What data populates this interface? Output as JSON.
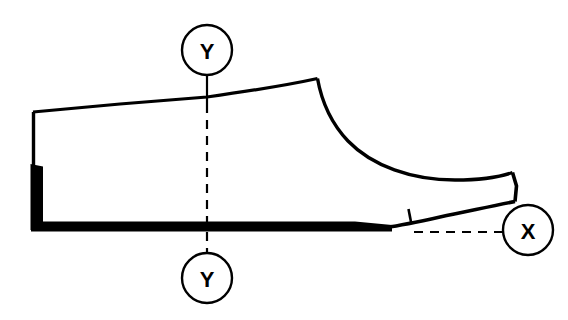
{
  "diagram": {
    "background_color": "#ffffff",
    "ink_color": "#000000",
    "width": 568,
    "height": 320
  },
  "markers": {
    "y_top": {
      "label": "Y",
      "cx": 207,
      "cy": 50,
      "r": 25
    },
    "y_bottom": {
      "label": "Y",
      "cx": 207,
      "cy": 278,
      "r": 25
    },
    "x_right": {
      "label": "X",
      "cx": 528,
      "cy": 230,
      "r": 25
    }
  },
  "section_lines": {
    "y_axis": {
      "name": "Y-Y section line",
      "x": 207,
      "solid_top_from_y": 75,
      "solid_top_to_y": 104,
      "dashed_from_y": 104,
      "dashed_to_y": 253,
      "style": "dashed"
    },
    "x_axis": {
      "name": "X section leader line",
      "y": 232,
      "from_x": 414,
      "to_x": 503,
      "style": "dashed"
    }
  },
  "shoe_outline": {
    "name": "shoe-last-profile",
    "heel_top_left": [
      33,
      112
    ],
    "peak_instep": [
      317,
      79
    ],
    "toe_tip_top": [
      513,
      172
    ],
    "toe_tip_bottom": [
      515,
      201
    ],
    "sole_bottom_y": 229,
    "heel_back_x": 33,
    "featherline_tick_x": 409
  },
  "geometry_paths": {
    "upper_topline": "M 33 112 L 207 97 C 250 91 285 85 317 79",
    "instep_curve": "M 317 79 C 322 104 336 133 364 152 C 400 175 455 182 513 172",
    "toe_tip": "M 513 172 L 515 201",
    "toe_underside": "M 515 201 C 480 209 440 216 409 222 C 400 224 392 226 385 228",
    "sole_top": "M 385 228 L 33 228",
    "heel_back": "M 33 228 L 33 112",
    "sole_bar": "M 31 221 L 392 221 L 392 231 L 31 231 Z",
    "heel_thick": "M 31 165 L 44 165 L 44 229 L 31 229 Z",
    "featherline_tick": "M 409 210 L 411 222"
  }
}
